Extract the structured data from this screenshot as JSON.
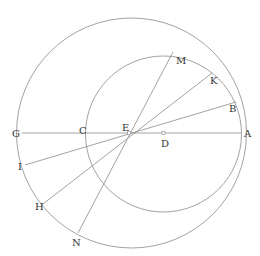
{
  "diagram": {
    "stroke_color": "#8a8a8a",
    "label_color": "#333333",
    "circles": [
      {
        "name": "outer-circle",
        "cx": 131.5,
        "cy": 133,
        "r": 115
      },
      {
        "name": "inner-circle",
        "cx": 163.5,
        "cy": 134,
        "r": 78
      }
    ],
    "lines": [
      {
        "name": "line-G-A",
        "from": "G",
        "to": "A",
        "x1": 22,
        "y1": 133,
        "x2": 241,
        "y2": 133
      },
      {
        "name": "line-M-N",
        "from": "M",
        "to": "N",
        "x1": 173,
        "y1": 52,
        "x2": 78,
        "y2": 233
      },
      {
        "name": "line-K-H",
        "from": "K",
        "to": "H",
        "x1": 212,
        "y1": 73,
        "x2": 43,
        "y2": 204
      },
      {
        "name": "line-B-I",
        "from": "B",
        "to": "I",
        "x1": 236,
        "y1": 102,
        "x2": 25,
        "y2": 165
      }
    ],
    "points": [
      {
        "label": "M",
        "x": 176,
        "y": 64
      },
      {
        "label": "K",
        "x": 210,
        "y": 84
      },
      {
        "label": "B",
        "x": 229,
        "y": 112
      },
      {
        "label": "A",
        "x": 244,
        "y": 137
      },
      {
        "label": "D",
        "x": 161,
        "y": 147
      },
      {
        "label": "E",
        "x": 122,
        "y": 131
      },
      {
        "label": "C",
        "x": 79,
        "y": 134
      },
      {
        "label": "G",
        "x": 12,
        "y": 137
      },
      {
        "label": "I",
        "x": 18,
        "y": 170
      },
      {
        "label": "H",
        "x": 35,
        "y": 210
      },
      {
        "label": "N",
        "x": 72,
        "y": 246
      }
    ],
    "markers": [
      {
        "name": "center-D-marker",
        "x": 163.5,
        "y": 133
      },
      {
        "name": "point-E-marker",
        "x": 129,
        "y": 133
      }
    ]
  }
}
